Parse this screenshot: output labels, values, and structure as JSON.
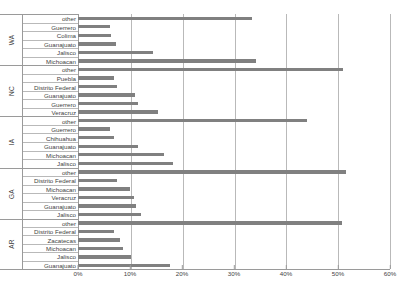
{
  "chart_data": {
    "type": "bar",
    "orientation": "horizontal",
    "title": "",
    "xlabel": "",
    "ylabel": "",
    "xlim": [
      0,
      60
    ],
    "xtick_labels": [
      "0%",
      "10%",
      "20%",
      "30%",
      "40%",
      "50%",
      "60%"
    ],
    "xtick_values": [
      0,
      10,
      20,
      30,
      40,
      50,
      60
    ],
    "grid": true,
    "legend": "none",
    "bar_color": "#808080",
    "units": "percent",
    "groups": [
      {
        "name": "WA",
        "categories": [
          "other",
          "Guerrero",
          "Colima",
          "Guanajuato",
          "Jalisco",
          "Michoacan"
        ],
        "values": [
          33.5,
          6.2,
          6.3,
          7.3,
          14.4,
          34.2
        ]
      },
      {
        "name": "NC",
        "categories": [
          "other",
          "Puebla",
          "Distrito Federal",
          "Guanajuato",
          "Guerrero",
          "Veracruz"
        ],
        "values": [
          51.0,
          7.0,
          7.5,
          11.0,
          11.5,
          15.3
        ]
      },
      {
        "name": "IA",
        "categories": [
          "other",
          "Guerrero",
          "Chihuahua",
          "Guanajuato",
          "Michoacan",
          "Jalisco"
        ],
        "values": [
          44.0,
          6.2,
          7.0,
          11.5,
          16.5,
          18.3
        ]
      },
      {
        "name": "GA",
        "categories": [
          "other",
          "Distrito Federal",
          "Michoacan",
          "Veracruz",
          "Guanajuato",
          "Jalisco"
        ],
        "values": [
          51.5,
          7.5,
          10.0,
          10.7,
          11.2,
          12.2
        ]
      },
      {
        "name": "AR",
        "categories": [
          "other",
          "Distrito Federal",
          "Zacatecas",
          "Michoacan",
          "Jalisco",
          "Guanajuato"
        ],
        "values": [
          50.8,
          7.0,
          8.0,
          8.6,
          10.2,
          17.6
        ]
      }
    ]
  }
}
